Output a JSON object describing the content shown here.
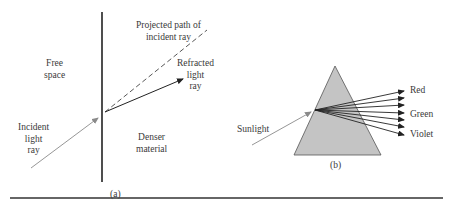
{
  "figure_a": {
    "caption": "(a)",
    "labels": {
      "free_space": [
        "Free",
        "space"
      ],
      "incident": [
        "Incident",
        "light",
        "ray"
      ],
      "projected": [
        "Projected path of",
        "incident ray"
      ],
      "refracted": [
        "Refracted",
        "light",
        "ray"
      ],
      "denser": [
        "Denser",
        "material"
      ]
    }
  },
  "figure_b": {
    "caption": "(b)",
    "labels": {
      "sunlight": "Sunlight",
      "red": "Red",
      "green": "Green",
      "violet": "Violet"
    },
    "dispersed_ray_count": 7
  },
  "colors": {
    "prism_fill": "#c4c4c4",
    "line": "#222222",
    "incident_ray": "#8a8a8a"
  }
}
